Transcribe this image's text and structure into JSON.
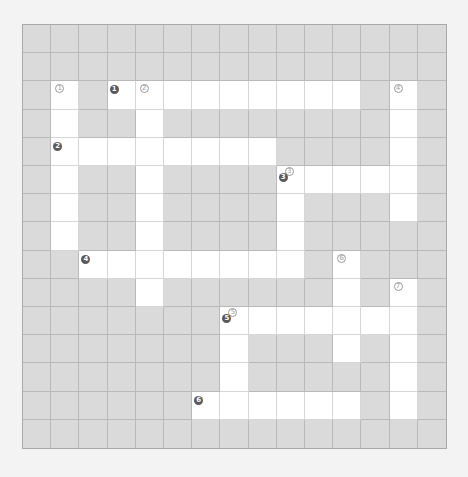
{
  "puzzle": {
    "rows": 15,
    "cols": 15,
    "colors": {
      "background": "#f3f3f3",
      "blocked_cell": "#dadada",
      "open_cell": "#ffffff",
      "grid_line": "#b9b9b9",
      "across_marker": "#5a5a5a",
      "down_marker": "#9a9a9a"
    },
    "open_cells": [
      [
        2,
        1
      ],
      [
        2,
        3
      ],
      [
        2,
        4
      ],
      [
        2,
        5
      ],
      [
        2,
        6
      ],
      [
        2,
        7
      ],
      [
        2,
        8
      ],
      [
        2,
        9
      ],
      [
        2,
        10
      ],
      [
        2,
        11
      ],
      [
        2,
        13
      ],
      [
        3,
        1
      ],
      [
        3,
        4
      ],
      [
        3,
        13
      ],
      [
        4,
        1
      ],
      [
        4,
        2
      ],
      [
        4,
        3
      ],
      [
        4,
        4
      ],
      [
        4,
        5
      ],
      [
        4,
        6
      ],
      [
        4,
        7
      ],
      [
        4,
        8
      ],
      [
        4,
        13
      ],
      [
        5,
        1
      ],
      [
        5,
        4
      ],
      [
        5,
        9
      ],
      [
        5,
        10
      ],
      [
        5,
        11
      ],
      [
        5,
        12
      ],
      [
        5,
        13
      ],
      [
        6,
        1
      ],
      [
        6,
        4
      ],
      [
        6,
        9
      ],
      [
        6,
        13
      ],
      [
        7,
        1
      ],
      [
        7,
        4
      ],
      [
        7,
        9
      ],
      [
        8,
        2
      ],
      [
        8,
        3
      ],
      [
        8,
        4
      ],
      [
        8,
        5
      ],
      [
        8,
        6
      ],
      [
        8,
        7
      ],
      [
        8,
        8
      ],
      [
        8,
        9
      ],
      [
        8,
        11
      ],
      [
        9,
        4
      ],
      [
        9,
        11
      ],
      [
        9,
        13
      ],
      [
        10,
        7
      ],
      [
        10,
        8
      ],
      [
        10,
        9
      ],
      [
        10,
        10
      ],
      [
        10,
        11
      ],
      [
        10,
        12
      ],
      [
        10,
        13
      ],
      [
        11,
        7
      ],
      [
        11,
        11
      ],
      [
        11,
        13
      ],
      [
        12,
        7
      ],
      [
        12,
        13
      ],
      [
        13,
        6
      ],
      [
        13,
        7
      ],
      [
        13,
        8
      ],
      [
        13,
        9
      ],
      [
        13,
        10
      ],
      [
        13,
        11
      ],
      [
        13,
        13
      ]
    ],
    "markers": [
      {
        "row": 2,
        "col": 1,
        "down": "1"
      },
      {
        "row": 2,
        "col": 3,
        "across": "1"
      },
      {
        "row": 2,
        "col": 4,
        "down": "2"
      },
      {
        "row": 2,
        "col": 13,
        "down": "4"
      },
      {
        "row": 4,
        "col": 1,
        "across": "2"
      },
      {
        "row": 5,
        "col": 9,
        "down": "3",
        "across": "3"
      },
      {
        "row": 8,
        "col": 2,
        "across": "4"
      },
      {
        "row": 8,
        "col": 11,
        "down": "6"
      },
      {
        "row": 9,
        "col": 13,
        "down": "7"
      },
      {
        "row": 10,
        "col": 7,
        "down": "5",
        "across": "5"
      },
      {
        "row": 13,
        "col": 6,
        "across": "6"
      }
    ]
  }
}
